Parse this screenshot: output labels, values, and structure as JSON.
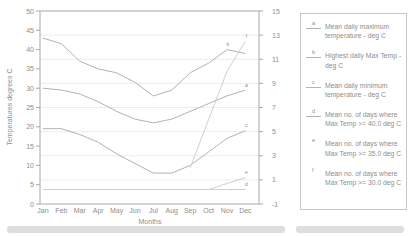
{
  "colors": {
    "line": "#b2b2b2",
    "line_faint": "#cfcfcf",
    "grid": "#ececec",
    "axis": "#a8a8a8",
    "text": "#8e8e8e"
  },
  "axes": {
    "y_left": {
      "title": "Temperatures degrees C",
      "min": 0,
      "max": 50,
      "ticks": [
        0,
        5,
        10,
        15,
        20,
        25,
        30,
        35,
        40,
        45,
        50
      ]
    },
    "y_right": {
      "min": -1,
      "max": 15,
      "ticks": [
        -1,
        1,
        3,
        5,
        7,
        9,
        11,
        13,
        15
      ]
    },
    "x": {
      "title": "Months"
    }
  },
  "legend": {
    "items": [
      {
        "marker": "a",
        "label": "Mean daily maximum temperature - deg C"
      },
      {
        "marker": "b",
        "label": "Highest daily Max Temp - deg C"
      },
      {
        "marker": "c",
        "label": "Mean daily minimum temperature - deg C"
      },
      {
        "marker": "d",
        "label": "Mean no. of days where Max Temp >= 40.0 deg C"
      },
      {
        "marker": "e",
        "label": "Mean no. of days where Max Temp >= 35.0 deg C"
      },
      {
        "marker": "f",
        "label": "Mean no. of days where Max Temp >= 30.0 deg C"
      }
    ]
  },
  "chart_data": {
    "type": "line",
    "title": "",
    "xlabel": "Months",
    "ylabel_left": "Temperatures degrees C",
    "ylim_left": [
      0,
      50
    ],
    "ylim_right": [
      -1,
      15
    ],
    "grid": "horizontal",
    "legend_position": "right",
    "categories": [
      "Jan",
      "Feb",
      "Mar",
      "Apr",
      "May",
      "Jun",
      "Jul",
      "Aug",
      "Sep",
      "Oct",
      "Nov",
      "Dec"
    ],
    "series": [
      {
        "id": "a",
        "name": "Mean daily maximum temperature - deg C",
        "axis": "left",
        "values": [
          30,
          29.5,
          28.5,
          26.5,
          24,
          22,
          21,
          22,
          24,
          26,
          28,
          29.5
        ],
        "draw_from": 0,
        "weight": "normal"
      },
      {
        "id": "b",
        "name": "Highest daily Max Temp - deg C",
        "axis": "left",
        "values": [
          43,
          41.5,
          37,
          35,
          34,
          31.5,
          28,
          29.5,
          34,
          36.5,
          40,
          39
        ],
        "draw_from": 0,
        "weight": "normal"
      },
      {
        "id": "c",
        "name": "Mean daily minimum temperature - deg C",
        "axis": "left",
        "values": [
          19.5,
          19.5,
          18,
          16,
          13,
          10.5,
          8,
          8,
          10,
          13.5,
          17,
          19
        ],
        "draw_from": 0,
        "weight": "normal"
      },
      {
        "id": "d",
        "name": "Mean no. of days where Max Temp >= 40.0 deg C",
        "axis": "right",
        "values": [
          0.2,
          0.2,
          0.2,
          0.2,
          0.2,
          0.2,
          0.2,
          0.2,
          0.2,
          0.2,
          0.2,
          0.2
        ],
        "draw_from": 0,
        "weight": "faint"
      },
      {
        "id": "e",
        "name": "Mean no. of days where Max Temp >= 35.0 deg C",
        "axis": "right",
        "values": [
          0,
          0,
          0,
          0,
          0,
          0,
          0,
          0,
          0,
          0.2,
          0.7,
          1.2
        ],
        "draw_from": 9,
        "weight": "faint"
      },
      {
        "id": "f",
        "name": "Mean no. of days where Max Temp >= 30.0 deg C",
        "axis": "right",
        "values": [
          12.5,
          12,
          9.5,
          6,
          2.5,
          0.5,
          0,
          0.3,
          2,
          6,
          10,
          12.5
        ],
        "draw_from": 8,
        "weight": "faint"
      }
    ],
    "point_labels": [
      {
        "series": "b",
        "month": "Nov",
        "text": "b"
      },
      {
        "series": "f",
        "month": "Dec",
        "text": "f"
      },
      {
        "series": "a",
        "month": "Dec",
        "text": "a"
      },
      {
        "series": "c",
        "month": "Dec",
        "text": "c"
      },
      {
        "series": "e",
        "month": "Dec",
        "text": "e"
      },
      {
        "series": "d",
        "month": "Dec",
        "text": "d"
      }
    ]
  }
}
